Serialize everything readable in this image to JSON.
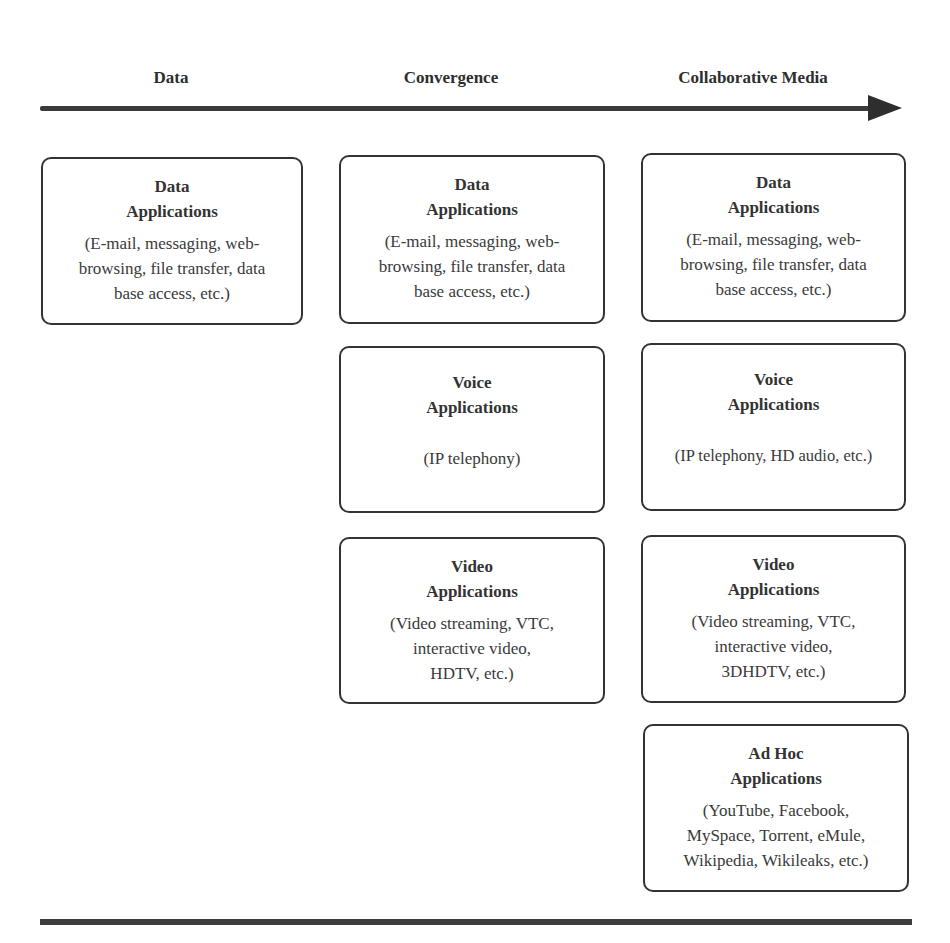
{
  "timeline": {
    "stages": [
      {
        "label": "Data"
      },
      {
        "label": "Convergence"
      },
      {
        "label": "Collaborative Media"
      }
    ],
    "arrow_direction": "right"
  },
  "columns": [
    {
      "stage": "Data",
      "boxes": [
        {
          "title_line1": "Data",
          "title_line2": "Applications",
          "desc_lines": [
            "(E-mail, messaging, web-",
            "browsing, file transfer, data",
            "base access, etc.)"
          ]
        }
      ]
    },
    {
      "stage": "Convergence",
      "boxes": [
        {
          "title_line1": "Data",
          "title_line2": "Applications",
          "desc_lines": [
            "(E-mail, messaging, web-",
            "browsing, file transfer, data",
            "base access, etc.)"
          ]
        },
        {
          "title_line1": "Voice",
          "title_line2": "Applications",
          "desc_lines": [
            "(IP telephony)"
          ]
        },
        {
          "title_line1": "Video",
          "title_line2": "Applications",
          "desc_lines": [
            "(Video streaming, VTC,",
            "interactive video,",
            "HDTV, etc.)"
          ]
        }
      ]
    },
    {
      "stage": "Collaborative Media",
      "boxes": [
        {
          "title_line1": "Data",
          "title_line2": "Applications",
          "desc_lines": [
            "(E-mail, messaging, web-",
            "browsing, file transfer, data",
            "base access, etc.)"
          ]
        },
        {
          "title_line1": "Voice",
          "title_line2": "Applications",
          "desc_lines": [
            "(IP telephony, HD audio, etc.)"
          ]
        },
        {
          "title_line1": "Video",
          "title_line2": "Applications",
          "desc_lines": [
            "(Video streaming, VTC,",
            "interactive video,",
            "3DHDTV, etc.)"
          ]
        },
        {
          "title_line1": "Ad Hoc",
          "title_line2": "Applications",
          "desc_lines": [
            "(YouTube, Facebook,",
            "MySpace, Torrent, eMule,",
            "Wikipedia, Wikileaks, etc.)"
          ]
        }
      ]
    }
  ],
  "colors": {
    "line": "#333333",
    "text": "#2e2e2e",
    "background": "#ffffff"
  }
}
